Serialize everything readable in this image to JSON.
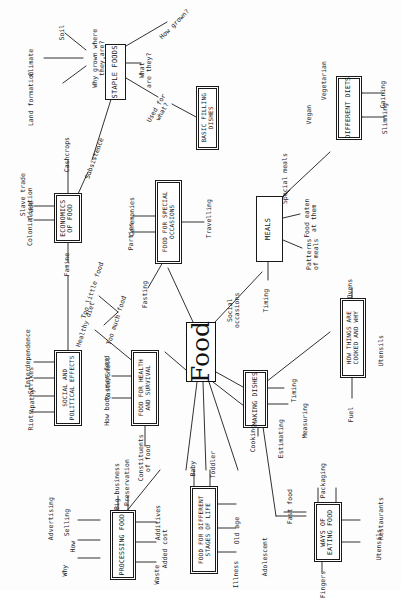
{
  "diagram": {
    "title": "Food",
    "type": "mind-map",
    "orientation": "rotated-90-ccw",
    "center": {
      "label": "Food"
    },
    "boxes": [
      {
        "id": "staple-foods",
        "label": "STAPLE FOODS",
        "double": false
      },
      {
        "id": "basic-filling-dishes",
        "label": "BASIC FILLING\nDISHES",
        "double": true
      },
      {
        "id": "different-diets",
        "label": "DIFFERENT DIETS",
        "double": true
      },
      {
        "id": "economics-of-food",
        "label": "ECONOMICS\nOF FOOD",
        "double": true
      },
      {
        "id": "food-for-special-occasions",
        "label": "FOOD FOR SPECIAL\nOCCASIONS",
        "double": true
      },
      {
        "id": "meals",
        "label": "MEALS",
        "double": false
      },
      {
        "id": "social-and-political-effects",
        "label": "SOCIAL AND\nPOLITICAL EFFECTS",
        "double": true
      },
      {
        "id": "food-for-health-and-survival",
        "label": "FOOD FOR HEALTH\nAND SURVIVAL",
        "double": true
      },
      {
        "id": "how-things-are-cooked-and-why",
        "label": "HOW THINGS ARE\nCOOKED AND WHY",
        "double": true
      },
      {
        "id": "making-dishes",
        "label": "MAKING DISHES",
        "double": true
      },
      {
        "id": "processing-food",
        "label": "PROCESSING FOOD",
        "double": true
      },
      {
        "id": "food-for-different-stages-of-life",
        "label": "FOOD FOR DIFFERENT\nSTAGES OF LIFE",
        "double": true
      },
      {
        "id": "ways-of-eating-food",
        "label": "WAYS OF\nEATING FOOD",
        "double": true
      }
    ],
    "leaves": [
      {
        "id": "climate",
        "label": "Climate",
        "parent": "why-grown-where-they-are"
      },
      {
        "id": "soil",
        "label": "Soil",
        "parent": "why-grown-where-they-are"
      },
      {
        "id": "land-formation",
        "label": "Land formation",
        "parent": "why-grown-where-they-are"
      },
      {
        "id": "why-grown-where-they-are",
        "label": "Why grown where\nthey are?",
        "parent": "staple-foods"
      },
      {
        "id": "what-are-they",
        "label": "What\nare they?",
        "parent": "staple-foods"
      },
      {
        "id": "how-grown",
        "label": "How grown?",
        "parent": "staple-foods"
      },
      {
        "id": "used-for-what",
        "label": "Used for\nwhat?",
        "parent": "staple-foods"
      },
      {
        "id": "cashcrops",
        "label": "Cashcrops",
        "parent": "economics-of-food"
      },
      {
        "id": "subsistence",
        "label": "Subsistence",
        "parent": "economics-of-food"
      },
      {
        "id": "slave-trade",
        "label": "Slave trade",
        "parent": "economics-of-food"
      },
      {
        "id": "trade",
        "label": "Trade",
        "parent": "economics-of-food"
      },
      {
        "id": "colonialisation",
        "label": "Colonialisation",
        "parent": "economics-of-food"
      },
      {
        "id": "famine",
        "label": "Famine",
        "parent": "economics-of-food"
      },
      {
        "id": "vegetarian",
        "label": "Vegetarian",
        "parent": "different-diets"
      },
      {
        "id": "vegan",
        "label": "Vegan",
        "parent": "different-diets"
      },
      {
        "id": "gaining",
        "label": "Gaining",
        "parent": "different-diets"
      },
      {
        "id": "slimming",
        "label": "Slimming",
        "parent": "different-diets"
      },
      {
        "id": "ceremonies",
        "label": "Ceremonies",
        "parent": "food-for-special-occasions"
      },
      {
        "id": "parties",
        "label": "Parties",
        "parent": "food-for-special-occasions"
      },
      {
        "id": "travelling",
        "label": "Travelling",
        "parent": "food-for-special-occasions"
      },
      {
        "id": "fasting",
        "label": "Fasting",
        "parent": "food-for-special-occasions"
      },
      {
        "id": "special-meals",
        "label": "Special meals",
        "parent": "meals"
      },
      {
        "id": "food-eaten-at-them",
        "label": "Food eaten\nat them",
        "parent": "meals"
      },
      {
        "id": "patterns-of-meals",
        "label": "Patterns\nof meals",
        "parent": "meals"
      },
      {
        "id": "timing-meals",
        "label": "Timing",
        "parent": "meals"
      },
      {
        "id": "social-occasions",
        "label": "Social\noccasions",
        "parent": "meals"
      },
      {
        "id": "interdependence",
        "label": "Interdependence",
        "parent": "social-and-political-effects"
      },
      {
        "id": "strikes",
        "label": "Strikes",
        "parent": "social-and-political-effects"
      },
      {
        "id": "apathy",
        "label": "Apathy",
        "parent": "social-and-political-effects"
      },
      {
        "id": "riots",
        "label": "Riots",
        "parent": "social-and-political-effects"
      },
      {
        "id": "too-little-food",
        "label": "Too little food",
        "parent": "food-for-health-and-survival"
      },
      {
        "id": "too-much-food",
        "label": "Too much food",
        "parent": "food-for-health-and-survival"
      },
      {
        "id": "healthy-diet",
        "label": "Healthy diet",
        "parent": "food-for-health-and-survival"
      },
      {
        "id": "taste-smell",
        "label": "Taste/Smell",
        "parent": "food-for-health-and-survival"
      },
      {
        "id": "how-body-uses-food",
        "label": "How body uses food",
        "parent": "food-for-health-and-survival"
      },
      {
        "id": "constituents-of-food",
        "label": "Constituents\nof food",
        "parent": "food-for-health-and-survival"
      },
      {
        "id": "ovens",
        "label": "Ovens",
        "parent": "how-things-are-cooked-and-why"
      },
      {
        "id": "utensils-cooked",
        "label": "Utensils",
        "parent": "how-things-are-cooked-and-why"
      },
      {
        "id": "fuel",
        "label": "Fuel",
        "parent": "how-things-are-cooked-and-why"
      },
      {
        "id": "cooking",
        "label": "Cooking",
        "parent": "making-dishes"
      },
      {
        "id": "estimating",
        "label": "Estimating",
        "parent": "making-dishes"
      },
      {
        "id": "measuring",
        "label": "Measuring",
        "parent": "making-dishes"
      },
      {
        "id": "timing-dishes",
        "label": "Timing",
        "parent": "making-dishes"
      },
      {
        "id": "advertising",
        "label": "Advertising",
        "parent": "processing-food"
      },
      {
        "id": "selling",
        "label": "Selling",
        "parent": "processing-food"
      },
      {
        "id": "how-processing",
        "label": "How",
        "parent": "processing-food"
      },
      {
        "id": "why-processing",
        "label": "Why",
        "parent": "processing-food"
      },
      {
        "id": "big-business",
        "label": "Big business",
        "parent": "processing-food"
      },
      {
        "id": "preservation",
        "label": "Preservation",
        "parent": "processing-food"
      },
      {
        "id": "additives",
        "label": "Additives",
        "parent": "processing-food"
      },
      {
        "id": "added-cost",
        "label": "Added cost",
        "parent": "processing-food"
      },
      {
        "id": "waste",
        "label": "Waste",
        "parent": "processing-food"
      },
      {
        "id": "baby",
        "label": "Baby",
        "parent": "food-for-different-stages-of-life"
      },
      {
        "id": "toddler",
        "label": "Toddler",
        "parent": "food-for-different-stages-of-life"
      },
      {
        "id": "old-age",
        "label": "Old age",
        "parent": "food-for-different-stages-of-life"
      },
      {
        "id": "illness",
        "label": "Illness",
        "parent": "food-for-different-stages-of-life"
      },
      {
        "id": "adolescent",
        "label": "Adolescent",
        "parent": "food-for-different-stages-of-life"
      },
      {
        "id": "fast-food",
        "label": "Fast food",
        "parent": "ways-of-eating-food"
      },
      {
        "id": "packaging",
        "label": "Packaging",
        "parent": "ways-of-eating-food"
      },
      {
        "id": "restaurants",
        "label": "Restaurants",
        "parent": "ways-of-eating-food"
      },
      {
        "id": "utensils-eating",
        "label": "Utensils",
        "parent": "ways-of-eating-food"
      },
      {
        "id": "fingers",
        "label": "Fingers",
        "parent": "ways-of-eating-food"
      }
    ]
  }
}
